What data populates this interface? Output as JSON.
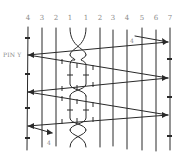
{
  "diagram": {
    "column_labels": [
      "4",
      "3",
      "2",
      "1",
      "1",
      "2",
      "3",
      "4",
      "5",
      "6",
      "7"
    ],
    "pin_label": "PIN Y",
    "annotation_top_right": "4",
    "annotation_bottom_left": "4",
    "colors": {
      "line": "#2a2a2a",
      "label": "#8a8a8a",
      "background": "#ffffff"
    }
  }
}
